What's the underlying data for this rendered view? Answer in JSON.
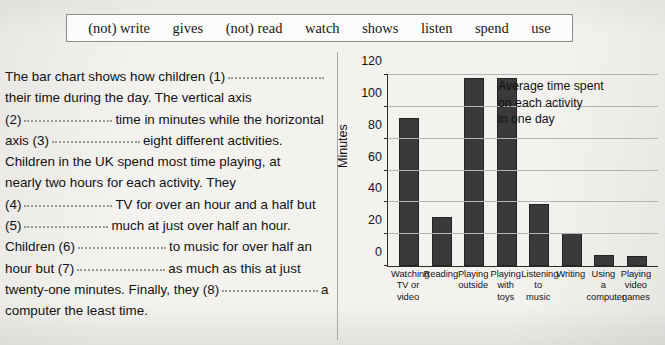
{
  "word_bank": {
    "words": [
      "(not) write",
      "gives",
      "(not) read",
      "watch",
      "shows",
      "listen",
      "spend",
      "use"
    ]
  },
  "passage": {
    "lines": [
      [
        {
          "t": "The bar chart shows how children (1)"
        },
        {
          "b": "w1"
        }
      ],
      [
        {
          "t": "their time during the day. The vertical axis"
        }
      ],
      [
        {
          "t": "(2)"
        },
        {
          "b": "w2"
        },
        {
          "t": "time in minutes while the horizontal"
        }
      ],
      [
        {
          "t": "axis (3)"
        },
        {
          "b": "w2"
        },
        {
          "t": "eight different activities."
        }
      ],
      [
        {
          "t": "Children in the UK spend most time playing, at"
        }
      ],
      [
        {
          "t": "nearly two hours for each activity. They"
        }
      ],
      [
        {
          "t": "(4)"
        },
        {
          "b": "w2"
        },
        {
          "t": "TV for over an hour and a half but"
        }
      ],
      [
        {
          "t": "(5)"
        },
        {
          "b": "w3"
        },
        {
          "t": "much at just over half an hour."
        }
      ],
      [
        {
          "t": "Children (6)"
        },
        {
          "b": "w2"
        },
        {
          "t": "to music for over half an"
        }
      ],
      [
        {
          "t": "hour but (7)"
        },
        {
          "b": "w2"
        },
        {
          "t": "as much as this at just"
        }
      ],
      [
        {
          "t": "twenty-one minutes. Finally, they (8)"
        },
        {
          "b": "w1"
        },
        {
          "t": "a"
        }
      ],
      [
        {
          "t": "computer the least time."
        }
      ]
    ]
  },
  "chart_data": {
    "type": "bar",
    "title": "",
    "annotation": [
      "Average time spent",
      "on each activity",
      "in one day"
    ],
    "categories": [
      "Watching\nTV or\nvideo",
      "Reading",
      "Playing\noutside",
      "Playing\nwith\ntoys",
      "Listening\nto\nmusic",
      "Writing",
      "Using\na\ncomputer",
      "Playing\nvideo\ngames"
    ],
    "values": [
      93,
      31,
      118,
      118,
      39,
      21,
      7,
      6
    ],
    "xlabel": "",
    "ylabel": "Minutes",
    "ylim": [
      0,
      120
    ],
    "yticks": [
      0,
      20,
      40,
      60,
      80,
      100,
      120
    ],
    "grid": true,
    "legend": "none",
    "bar_color": "#3a3a3a"
  }
}
